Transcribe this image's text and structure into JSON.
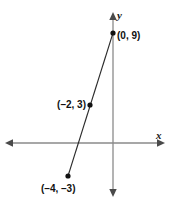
{
  "figure": {
    "title": "",
    "width": 171,
    "height": 206,
    "background": "#ffffff",
    "axis_color": "#8a8a8a",
    "line_color": "#2b2b2b",
    "point_color": "#111111",
    "text_color": "#111111"
  },
  "axes": {
    "x_label": "x",
    "y_label": "y"
  },
  "labels": {
    "p0": "(0, 9)",
    "p1": "(–2, 3)",
    "p2": "(–4, –3)"
  },
  "chart_data": {
    "type": "line",
    "title": "",
    "xlabel": "x",
    "ylabel": "y",
    "grid": false,
    "legend": "none",
    "xlim": [
      -7,
      7
    ],
    "ylim": [
      -7,
      12
    ],
    "series": [
      {
        "name": "line through plotted points",
        "x": [
          -4,
          -2,
          0
        ],
        "y": [
          -3,
          3,
          9
        ],
        "point_labels": [
          "(–4, –3)",
          "(–2, 3)",
          "(0, 9)"
        ],
        "markers": true,
        "slope": 3,
        "y_intercept": 9
      }
    ],
    "annotations": [
      {
        "text": "(0, 9)",
        "x": 0,
        "y": 9,
        "position": "right"
      },
      {
        "text": "(–2, 3)",
        "x": -2,
        "y": 3,
        "position": "left"
      },
      {
        "text": "(–4, –3)",
        "x": -4,
        "y": -3,
        "position": "below-left"
      }
    ]
  }
}
